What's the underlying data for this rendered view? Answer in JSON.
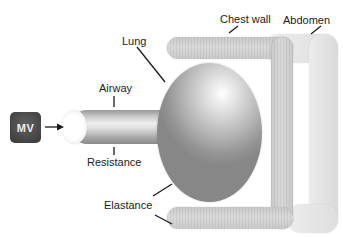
{
  "diagram": {
    "ventilator": {
      "label": "MV"
    },
    "labels": {
      "lung": "Lung",
      "chest_wall": "Chest wall",
      "abdomen": "Abdomen",
      "airway": "Airway",
      "resistance": "Resistance",
      "elastance": "Elastance"
    },
    "colors": {
      "background": "#ffffff",
      "mv_box": "#474747",
      "mv_text": "#ededed",
      "chest_wall_fill": "#d1d1d1",
      "abdomen_fill": "#e8e8e8",
      "lung_highlight": "#ffffff",
      "lung_shadow": "#878787",
      "tube_fill": "#cfcfcf",
      "leader_line": "#1a1a1a"
    }
  }
}
